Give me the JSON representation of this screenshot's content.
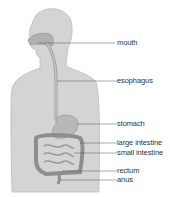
{
  "diagram": {
    "colors": {
      "body": "#d4d4d4",
      "outline": "#9a9a9a",
      "organ": "#b8b8b8",
      "organ_dark": "#8e8e8e",
      "leader": "#555555",
      "text": "#333333"
    },
    "labels": [
      {
        "id": "mouth",
        "text": "mouth"
      },
      {
        "id": "esophagus",
        "text": "esophagus"
      },
      {
        "id": "stomach",
        "text": "stomach"
      },
      {
        "id": "large-intestine",
        "text": "large intestine"
      },
      {
        "id": "small-intestine",
        "text": "small intestine"
      },
      {
        "id": "rectum",
        "text": "rectum"
      },
      {
        "id": "anus",
        "text": "anus"
      }
    ]
  }
}
